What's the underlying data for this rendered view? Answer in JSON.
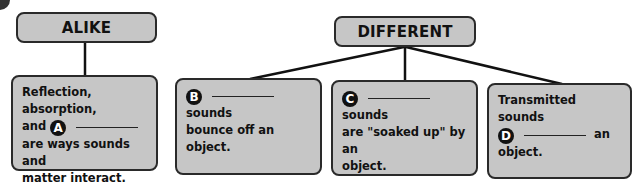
{
  "alike": {
    "title": "ALIKE",
    "card": {
      "line1": "Reflection, absorption,",
      "and": "and",
      "badge": "A",
      "line3": "are ways sounds and",
      "line4": "matter interact."
    }
  },
  "different": {
    "title": "DIFFERENT",
    "cards": [
      {
        "badge": "B",
        "after_blank": "sounds",
        "line2": "bounce off an object."
      },
      {
        "badge": "C",
        "after_blank": "sounds",
        "line2": "are \"soaked up\" by an",
        "line3": "object."
      },
      {
        "line1": "Transmitted sounds",
        "badge": "D",
        "after_blank": "an",
        "line3": "object."
      }
    ]
  },
  "colors": {
    "box_fill": "#c6c6c6",
    "border": "#2a2a2a",
    "badge": "#111111"
  }
}
